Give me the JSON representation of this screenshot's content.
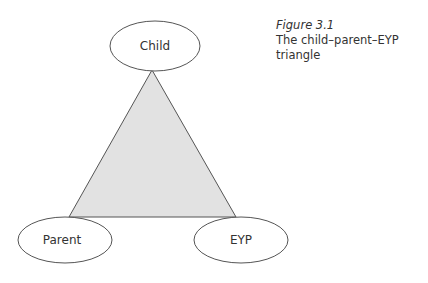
{
  "figure": {
    "number": "Figure 3.1",
    "title": "The child–parent–EYP triangle"
  },
  "nodes": {
    "top": "Child",
    "left": "Parent",
    "right": "EYP"
  },
  "colors": {
    "triangle_fill": "#e2e2e2",
    "stroke": "#555555",
    "text": "#333333"
  }
}
